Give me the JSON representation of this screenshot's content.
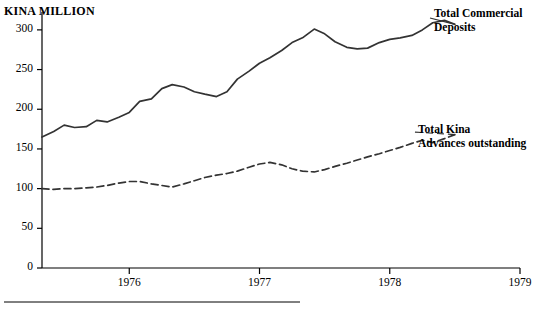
{
  "chart_data": {
    "type": "line",
    "title": "",
    "unit_label": "KINA MILLION",
    "xlabel": "",
    "ylabel": "",
    "ylim": [
      0,
      320
    ],
    "yticks": [
      0,
      50,
      100,
      150,
      200,
      250,
      300
    ],
    "xlim": [
      1975.33,
      1979.0
    ],
    "xticks": [
      1976,
      1977,
      1978,
      1979
    ],
    "xtick_labels": [
      "1976",
      "1977",
      "1978",
      "1979"
    ],
    "grid": false,
    "legend_position": "inline-annotations",
    "series": [
      {
        "name": "Total Commercial Deposits",
        "style": "solid",
        "color": "#333333",
        "x": [
          1975.33,
          1975.42,
          1975.5,
          1975.58,
          1975.67,
          1975.75,
          1975.83,
          1975.92,
          1976.0,
          1976.08,
          1976.17,
          1976.25,
          1976.33,
          1976.42,
          1976.5,
          1976.58,
          1976.67,
          1976.75,
          1976.83,
          1976.92,
          1977.0,
          1977.08,
          1977.17,
          1977.25,
          1977.33,
          1977.42,
          1977.5,
          1977.58,
          1977.67,
          1977.75,
          1977.83,
          1977.92,
          1978.0,
          1978.08,
          1978.17,
          1978.25,
          1978.33,
          1978.42,
          1978.5
        ],
        "values": [
          165,
          172,
          180,
          177,
          178,
          186,
          184,
          190,
          196,
          210,
          213,
          226,
          231,
          228,
          222,
          219,
          216,
          222,
          238,
          248,
          258,
          265,
          274,
          284,
          290,
          301,
          295,
          285,
          278,
          276,
          277,
          284,
          288,
          290,
          293,
          300,
          309,
          312,
          307
        ]
      },
      {
        "name": "Total Kina Advances outstanding",
        "style": "dashed",
        "color": "#333333",
        "x": [
          1975.33,
          1975.42,
          1975.5,
          1975.58,
          1975.67,
          1975.75,
          1975.83,
          1975.92,
          1976.0,
          1976.08,
          1976.17,
          1976.25,
          1976.33,
          1976.42,
          1976.5,
          1976.58,
          1976.67,
          1976.75,
          1976.83,
          1976.92,
          1977.0,
          1977.08,
          1977.17,
          1977.25,
          1977.33,
          1977.42,
          1977.5,
          1977.58,
          1977.67,
          1977.75,
          1977.83,
          1977.92,
          1978.0,
          1978.08,
          1978.17,
          1978.25,
          1978.33,
          1978.42,
          1978.5
        ],
        "values": [
          100,
          99,
          100,
          100,
          101,
          102,
          104,
          107,
          109,
          109,
          106,
          104,
          102,
          106,
          110,
          114,
          117,
          119,
          122,
          127,
          131,
          133,
          130,
          125,
          122,
          121,
          124,
          128,
          132,
          136,
          140,
          144,
          148,
          152,
          157,
          161,
          158,
          163,
          168
        ]
      }
    ],
    "annotations": [
      {
        "name": "deposits-label",
        "text": "Total Commercial\nDeposits",
        "target_series": "Total Commercial Deposits"
      },
      {
        "name": "advances-label",
        "text": "Total Kina\nAdvances outstanding",
        "target_series": "Total Kina Advances outstanding"
      }
    ]
  }
}
